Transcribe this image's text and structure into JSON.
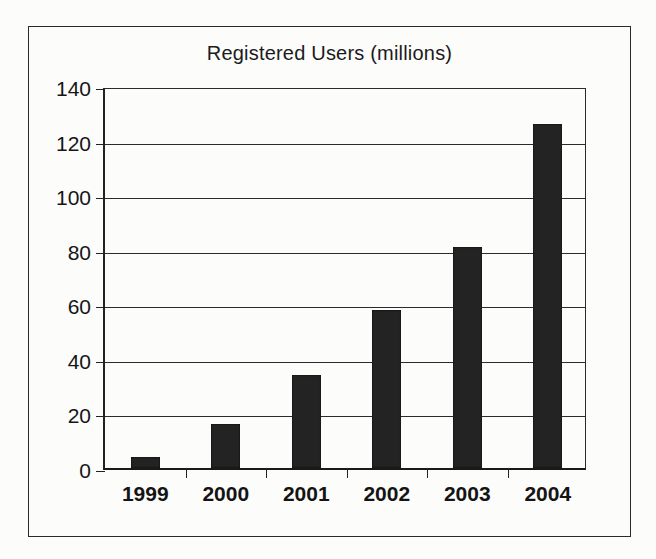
{
  "figure": {
    "background_color": "#fcfcfb",
    "frame_color": "#2a2a2a",
    "bar_color": "#232323"
  },
  "chart_data": {
    "type": "bar",
    "title": "Registered Users (millions)",
    "xlabel": "",
    "ylabel": "",
    "categories": [
      "1999",
      "2000",
      "2001",
      "2002",
      "2003",
      "2004"
    ],
    "values": [
      4,
      16,
      34,
      58,
      81,
      126
    ],
    "ylim": [
      0,
      140
    ],
    "yticks": [
      0,
      20,
      40,
      60,
      80,
      100,
      120,
      140
    ],
    "ytick_labels": [
      "0",
      "20",
      "40",
      "60",
      "80",
      "100",
      "120",
      "140"
    ],
    "grid": true,
    "grid_axis": "y",
    "legend": false,
    "legend_position": "none",
    "series": [
      {
        "name": "Registered Users",
        "values": [
          4,
          16,
          34,
          58,
          81,
          126
        ]
      }
    ],
    "annotations": []
  }
}
